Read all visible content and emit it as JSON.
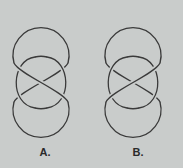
{
  "figures": [
    {
      "id": "A",
      "label": "A.",
      "description": "knot diagram with three stacked loops",
      "central_crossing_over": "upper-left-to-lower-right"
    },
    {
      "id": "B",
      "label": "B.",
      "description": "knot diagram with three stacked loops",
      "central_crossing_over": "lower-left-to-upper-right"
    }
  ],
  "colors": {
    "background": "#c9cccb",
    "stroke": "#3a3a3a",
    "label": "#2a2a2a"
  }
}
